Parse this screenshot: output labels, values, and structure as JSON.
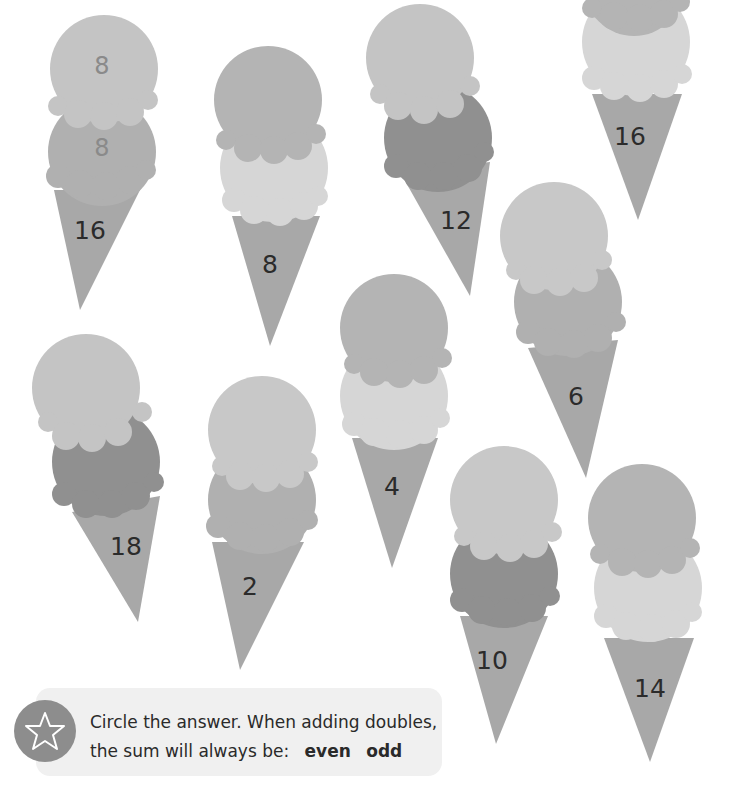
{
  "worksheet": {
    "cones": [
      {
        "id": "cone-1",
        "scoop_numbers": [
          "8",
          "8"
        ],
        "cone_number": "16",
        "scoops": [
          "#c4c4c4",
          "#b0b0b0"
        ]
      },
      {
        "id": "cone-2",
        "scoop_numbers": [],
        "cone_number": "8",
        "scoops": [
          "#b4b4b4",
          "#d6d6d6"
        ]
      },
      {
        "id": "cone-3",
        "scoop_numbers": [],
        "cone_number": "12",
        "scoops": [
          "#c4c4c4",
          "#909090"
        ]
      },
      {
        "id": "cone-4",
        "scoop_numbers": [],
        "cone_number": "16",
        "scoops": [
          "#b4b4b4",
          "#d6d6d6"
        ]
      },
      {
        "id": "cone-5",
        "scoop_numbers": [],
        "cone_number": "6",
        "scoops": [
          "#c8c8c8",
          "#b0b0b0"
        ]
      },
      {
        "id": "cone-6",
        "scoop_numbers": [],
        "cone_number": "18",
        "scoops": [
          "#c4c4c4",
          "#909090"
        ]
      },
      {
        "id": "cone-7",
        "scoop_numbers": [],
        "cone_number": "2",
        "scoops": [
          "#c8c8c8",
          "#b0b0b0"
        ]
      },
      {
        "id": "cone-8",
        "scoop_numbers": [],
        "cone_number": "4",
        "scoops": [
          "#b4b4b4",
          "#d6d6d6"
        ]
      },
      {
        "id": "cone-9",
        "scoop_numbers": [],
        "cone_number": "10",
        "scoops": [
          "#c8c8c8",
          "#909090"
        ]
      },
      {
        "id": "cone-10",
        "scoop_numbers": [],
        "cone_number": "14",
        "scoops": [
          "#b4b4b4",
          "#d6d6d6"
        ]
      }
    ],
    "cone_color": "#a8a8a8"
  },
  "tip": {
    "icon": "star-icon",
    "line1": "Circle the answer. When adding doubles,",
    "line2": "the sum will always be:",
    "option_even": "even",
    "option_odd": "odd"
  }
}
